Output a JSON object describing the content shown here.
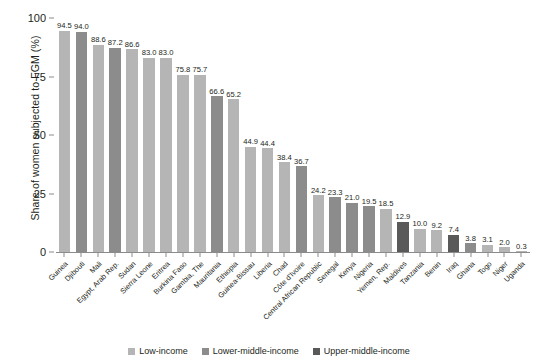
{
  "chart_data": {
    "type": "bar",
    "title": "",
    "xlabel": "",
    "ylabel": "Share of women subjected to FGM (%)",
    "ylim": [
      0,
      100
    ],
    "yticks": [
      "0",
      "25",
      "50",
      "75",
      "100"
    ],
    "grid": false,
    "legend_position": "bottom",
    "categories": [
      "Guinea",
      "Djibouti",
      "Mali",
      "Egypt, Arab Rep.",
      "Sudan",
      "Sierra Leone",
      "Eritrea",
      "Burkina Faso",
      "Gambia, The",
      "Mauritania",
      "Ethiopia",
      "Guinea-Bissau",
      "Liberia",
      "Chad",
      "Côte d'Ivoire",
      "Central African Republic",
      "Senegal",
      "Kenya",
      "Nigeria",
      "Yemen, Rep.",
      "Maldives",
      "Tanzania",
      "Benin",
      "Iraq",
      "Ghana",
      "Togo",
      "Niger",
      "Uganda"
    ],
    "values": [
      94.5,
      94.0,
      88.6,
      87.2,
      86.6,
      83.0,
      83.0,
      75.8,
      75.7,
      66.6,
      65.2,
      44.9,
      44.4,
      38.4,
      36.7,
      24.2,
      23.3,
      21.0,
      19.5,
      18.5,
      12.9,
      10.0,
      9.2,
      7.4,
      3.8,
      3.1,
      2.0,
      0.3
    ],
    "value_labels": [
      "94.5",
      "94.0",
      "88.6",
      "87.2",
      "86.6",
      "83.0",
      "83.0",
      "75.8",
      "75.7",
      "66.6",
      "65.2",
      "44.9",
      "44.4",
      "38.4",
      "36.7",
      "24.2",
      "23.3",
      "21.0",
      "19.5",
      "18.5",
      "12.9",
      "10.0",
      "9.2",
      "7.4",
      "3.8",
      "3.1",
      "2.0",
      "0.3"
    ],
    "groups": [
      "low",
      "lower-middle",
      "low",
      "lower-middle",
      "low",
      "low",
      "low",
      "low",
      "low",
      "lower-middle",
      "low",
      "low",
      "low",
      "low",
      "lower-middle",
      "low",
      "lower-middle",
      "lower-middle",
      "lower-middle",
      "low",
      "upper-middle",
      "low",
      "low",
      "upper-middle",
      "lower-middle",
      "low",
      "low",
      "low"
    ],
    "series": [
      {
        "name": "Low-income",
        "key": "low",
        "color": "#b5b5b5"
      },
      {
        "name": "Lower-middle-income",
        "key": "lower-middle",
        "color": "#8c8c8c"
      },
      {
        "name": "Upper-middle-income",
        "key": "upper-middle",
        "color": "#595959"
      }
    ]
  },
  "legend": {
    "items": [
      {
        "label": "Low-income",
        "color": "#b5b5b5"
      },
      {
        "label": "Lower-middle-income",
        "color": "#8c8c8c"
      },
      {
        "label": "Upper-middle-income",
        "color": "#595959"
      }
    ]
  },
  "axis": {
    "y_title": "Share of women subjected to FGM (%)"
  }
}
